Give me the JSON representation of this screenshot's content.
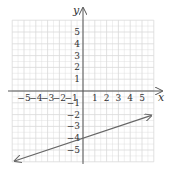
{
  "chart_data": {
    "type": "line",
    "title": "",
    "xlabel": "x",
    "ylabel": "y",
    "xlim": [
      -6,
      6
    ],
    "ylim": [
      -6,
      6
    ],
    "grid": true,
    "x_ticks": [
      -5,
      -4,
      -3,
      -2,
      -1,
      1,
      2,
      3,
      4,
      5
    ],
    "y_ticks": [
      5,
      4,
      3,
      2,
      1,
      -1,
      -2,
      -3,
      -4,
      -5
    ],
    "x_tick_labels": [
      "−5",
      "−4",
      "−3",
      "−2",
      "−1",
      "1",
      "2",
      "3",
      "4",
      "5"
    ],
    "y_tick_labels": [
      "5",
      "4",
      "3",
      "2",
      "1",
      "−1",
      "−2",
      "−3",
      "−4",
      "−5"
    ],
    "series": [
      {
        "name": "line",
        "equation": "y = (1/3)x - 4",
        "slope": 0.3333,
        "intercept": -4,
        "x": [
          -5.8,
          5.8
        ],
        "y": [
          -5.93,
          -2.07
        ],
        "arrows": "both",
        "color": "#666666"
      }
    ]
  },
  "colors": {
    "grid": "#d9d9d9",
    "axis": "#555555",
    "line": "#666666"
  }
}
